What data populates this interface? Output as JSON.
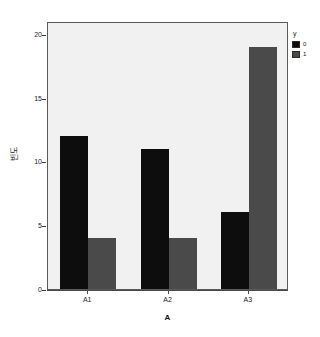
{
  "chart_data": {
    "type": "bar",
    "title": "",
    "subtitle": "",
    "xlabel": "A",
    "ylabel": "빈도",
    "categories": [
      "A1",
      "A2",
      "A3"
    ],
    "series": [
      {
        "name": "0",
        "values": [
          12,
          11,
          6
        ],
        "color": "#0d0d0d"
      },
      {
        "name": "1",
        "values": [
          4,
          4,
          19
        ],
        "color": "#4a4a4a"
      }
    ],
    "ylim": [
      0,
      21
    ],
    "yticks": [
      0,
      5,
      10,
      15,
      20
    ],
    "ytick_labels": [
      "0",
      "5",
      "10",
      "15",
      "20"
    ],
    "grid": false,
    "legend": {
      "title": "y",
      "position": "right-top",
      "entries": [
        {
          "label": "0",
          "color": "#0d0d0d"
        },
        {
          "label": "1",
          "color": "#4a4a4a"
        }
      ]
    },
    "plot_background": "#f1f1f1",
    "page_background": "#ffffff",
    "frame_color": "#5a5a5a"
  }
}
